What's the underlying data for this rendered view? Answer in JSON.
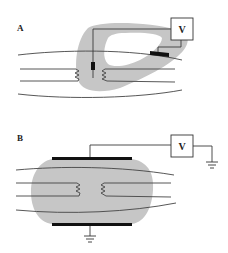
{
  "figure": {
    "panels": [
      {
        "id": "A",
        "label": "A",
        "meter_label": "V",
        "description": "Intracellular/extracellular electrode recording across a nerve fiber bundle with sucrose-gap-like bath"
      },
      {
        "id": "B",
        "label": "B",
        "meter_label": "V",
        "description": "Plate electrodes above and below a nerve bundle in bath, grounded reference"
      }
    ],
    "colors": {
      "bath": "#c6c6c6",
      "lines": "#3a3a3a",
      "electrode": "#111111",
      "background": "#ffffff"
    }
  }
}
